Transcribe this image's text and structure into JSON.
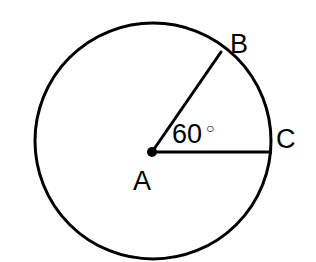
{
  "figure": {
    "type": "geometry-diagram",
    "background_color": "#ffffff",
    "stroke_color": "#000000",
    "width": 316,
    "height": 262
  },
  "circle": {
    "name": "circle-A",
    "center_x": 153,
    "center_y": 141,
    "radius": 118,
    "stroke_width": 3,
    "fill": "none"
  },
  "center_point": {
    "name": "center-dot-A",
    "x": 152,
    "y": 152,
    "radius": 5,
    "fill": "#000000"
  },
  "radii": [
    {
      "name": "radius-AB",
      "from_label": "A",
      "to_label": "B",
      "x1": 152,
      "y1": 152,
      "x2": 221,
      "y2": 52,
      "stroke_width": 3
    },
    {
      "name": "radius-AC",
      "from_label": "A",
      "to_label": "C",
      "x1": 152,
      "y1": 152,
      "x2": 272,
      "y2": 152,
      "stroke_width": 3
    }
  ],
  "labels": {
    "center": "A",
    "point_b": "B",
    "point_c": "C"
  },
  "angle": {
    "name": "central-angle-BAC",
    "value": "60",
    "degree_symbol": "○",
    "full_text": "60 °",
    "vertex": "A",
    "ray_start": "C",
    "ray_end": "B"
  }
}
